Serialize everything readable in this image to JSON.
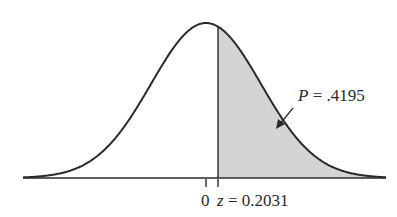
{
  "figure": {
    "type": "standard-normal-curve",
    "shaded_region": "right tail beyond z",
    "colors": {
      "curve": "#2a2a2a",
      "shade": "#d4d4d4",
      "axis": "#2a2a2a",
      "background": "#ffffff"
    },
    "labels": {
      "mean_tick": "0",
      "z_var": "z",
      "z_equals": " = 0.2031",
      "p_var": "P",
      "p_equals": " = .4195"
    },
    "values": {
      "z": 0.2031,
      "p": 0.4195
    }
  }
}
